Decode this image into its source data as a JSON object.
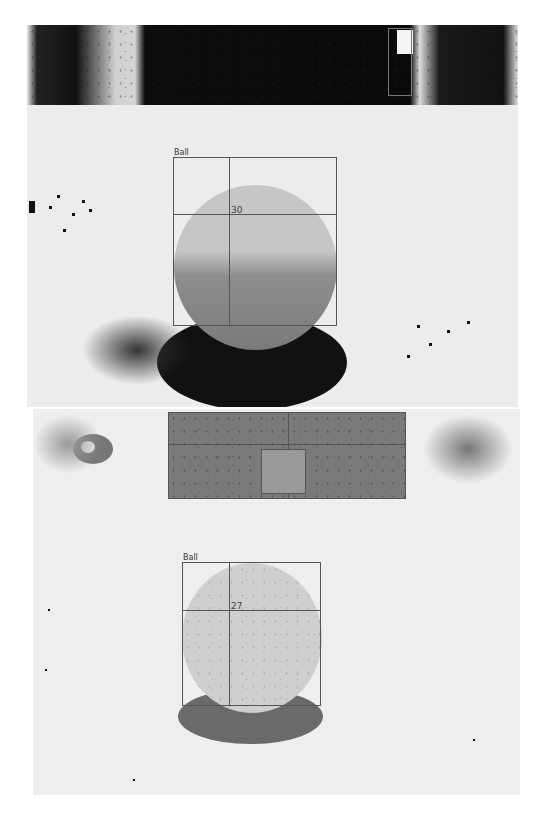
{
  "figure": {
    "panels": [
      {
        "id": "top",
        "object_label": "Ball",
        "measurement": "30",
        "background_band": "dark",
        "sphere_tone": "#c6c6c6",
        "shadow_tone": "#111111"
      },
      {
        "id": "bottom",
        "object_label": "Ball",
        "measurement": "27",
        "background_band": "gray",
        "sphere_tone": "#cfcfcf",
        "shadow_tone": "#6a6a6a"
      }
    ]
  },
  "colors": {
    "background": "#ececec",
    "box_outline": "#555555",
    "dark_band": "#0d0d0d",
    "gray_band": "#7a7a7a"
  }
}
